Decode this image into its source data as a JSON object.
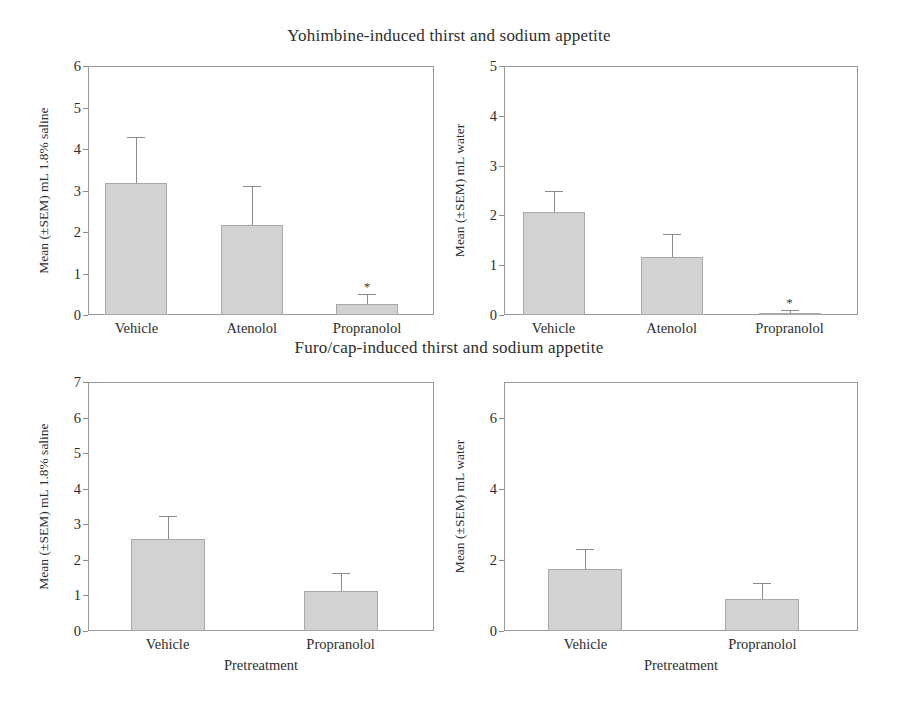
{
  "figure": {
    "titles": {
      "top": "Yohimbine-induced thirst and sodium appetite",
      "bottom": "Furo/cap-induced thirst and sodium appetite"
    }
  },
  "chart_data": [
    {
      "id": "top-left",
      "type": "bar",
      "title": "Yohimbine-induced thirst and sodium appetite",
      "xlabel": "",
      "ylabel": "Mean (±SEM) mL 1.8% saline",
      "ylim": [
        0,
        6
      ],
      "yticks": [
        0,
        1,
        2,
        3,
        4,
        5,
        6
      ],
      "grid": false,
      "legend": "none",
      "categories": [
        "Vehicle",
        "Atenolol",
        "Propranolol"
      ],
      "values": [
        3.18,
        2.17,
        0.27
      ],
      "errors": [
        1.1,
        0.93,
        0.23
      ],
      "annotations": [
        "",
        "",
        "*"
      ]
    },
    {
      "id": "top-right",
      "type": "bar",
      "title": "Yohimbine-induced thirst and sodium appetite",
      "xlabel": "",
      "ylabel": "Mean (±SEM) mL water",
      "ylim": [
        0,
        5
      ],
      "yticks": [
        0,
        1,
        2,
        3,
        4,
        5
      ],
      "grid": false,
      "legend": "none",
      "categories": [
        "Vehicle",
        "Atenolol",
        "Propranolol"
      ],
      "values": [
        2.07,
        1.17,
        0.05
      ],
      "errors": [
        0.43,
        0.45,
        0.05
      ],
      "annotations": [
        "",
        "",
        "*"
      ]
    },
    {
      "id": "bottom-left",
      "type": "bar",
      "title": "Furo/cap-induced thirst and sodium appetite",
      "xlabel": "Pretreatment",
      "ylabel": "Mean (±SEM) mL 1.8% saline",
      "ylim": [
        0,
        7
      ],
      "yticks": [
        0,
        1,
        2,
        3,
        4,
        5,
        6,
        7
      ],
      "grid": false,
      "legend": "none",
      "categories": [
        "Vehicle",
        "Propranolol"
      ],
      "values": [
        2.6,
        1.12
      ],
      "errors": [
        0.62,
        0.52
      ],
      "annotations": [
        "",
        ""
      ]
    },
    {
      "id": "bottom-right",
      "type": "bar",
      "title": "Furo/cap-induced thirst and sodium appetite",
      "xlabel": "Pretreatment",
      "ylabel": "Mean (±SEM) mL water",
      "ylim": [
        0,
        7
      ],
      "yticks": [
        0,
        2,
        4,
        6
      ],
      "grid": false,
      "legend": "none",
      "categories": [
        "Vehicle",
        "Propranolol"
      ],
      "values": [
        1.75,
        0.9
      ],
      "errors": [
        0.55,
        0.45
      ],
      "annotations": [
        "",
        ""
      ]
    }
  ],
  "style": {
    "bar_fill": "#d2d2d2",
    "bar_stroke": "#a8a8a8",
    "axis_color": "#9a9a9a",
    "text_color": "#2d2d2d",
    "background": "#ffffff"
  }
}
